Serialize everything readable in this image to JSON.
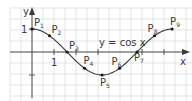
{
  "figure": {
    "function_label": "y = cos x",
    "x_axis_label": "x",
    "y_axis_label": "y",
    "y_tick_label": "1",
    "x_tick_label": "1",
    "colors": {
      "grid": "#d4d4d4",
      "axis": "#3a3a3a",
      "curve": "#3a3a3a",
      "point": "#1a1a1a",
      "text": "#3a3a3a"
    }
  },
  "chart_data": {
    "type": "line",
    "title": "y = cos x",
    "xlabel": "x",
    "ylabel": "y",
    "grid": true,
    "xlim": [
      -1.3,
      7.0
    ],
    "ylim": [
      -1.6,
      1.6
    ],
    "series": [
      {
        "name": "y = cos x",
        "x_range": [
          0,
          6.2832
        ],
        "formula": "cos(x)"
      }
    ],
    "points": [
      {
        "label": "P",
        "index": "1",
        "x": 0.0,
        "y": 1.0
      },
      {
        "label": "P",
        "index": "2",
        "x": 0.7854,
        "y": 0.707
      },
      {
        "label": "P",
        "index": "3",
        "x": 1.5708,
        "y": 0.0
      },
      {
        "label": "P",
        "index": "4",
        "x": 2.3562,
        "y": -0.707
      },
      {
        "label": "P",
        "index": "5",
        "x": 3.1416,
        "y": -1.0
      },
      {
        "label": "P",
        "index": "6",
        "x": 3.927,
        "y": -0.707
      },
      {
        "label": "P",
        "index": "7",
        "x": 4.7124,
        "y": 0.0
      },
      {
        "label": "P",
        "index": "8",
        "x": 5.4978,
        "y": 0.707
      },
      {
        "label": "P",
        "index": "9",
        "x": 6.2832,
        "y": 1.0
      }
    ],
    "annotations": [
      "1 (x tick)",
      "1 (y tick)",
      "y = cos x"
    ]
  }
}
